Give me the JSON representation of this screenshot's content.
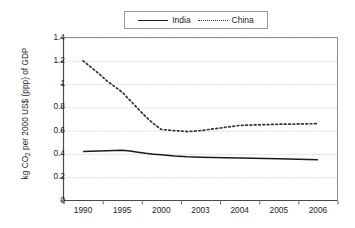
{
  "chart_data": {
    "type": "line",
    "title": "",
    "xlabel": "",
    "ylabel": "kg CO2 per 2000 US$ (ppp) of GDP",
    "ylabel_parts": {
      "before": "kg CO",
      "sub": "2",
      "after": " per 2000 US$ (ppp) of GDP"
    },
    "categories": [
      "1990",
      "1995",
      "2000",
      "2003",
      "2004",
      "2005",
      "2006"
    ],
    "ylim": [
      0,
      1.4
    ],
    "ytick_labels": [
      "0",
      "0.2",
      "0.4",
      "0.6",
      "0.8",
      "1",
      "1.2",
      "1.4"
    ],
    "ytick_values": [
      0,
      0.2,
      0.4,
      0.6,
      0.8,
      1.0,
      1.2,
      1.4
    ],
    "grid": "horizontal-dotted",
    "legend_position": "top-center",
    "series": [
      {
        "name": "India",
        "style": "solid",
        "color": "#1a1a1a",
        "values": [
          0.42,
          0.43,
          0.4,
          0.37,
          0.365,
          0.36,
          0.35
        ],
        "dense_x": [
          1990,
          1991,
          1992,
          1993,
          1994,
          1995,
          1996,
          1997,
          1998,
          1999,
          2000,
          2001,
          2002,
          2003,
          2004,
          2005,
          2006
        ],
        "dense_y": [
          0.42,
          0.423,
          0.425,
          0.428,
          0.43,
          0.432,
          0.425,
          0.415,
          0.405,
          0.398,
          0.392,
          0.382,
          0.375,
          0.372,
          0.365,
          0.358,
          0.35
        ]
      },
      {
        "name": "China",
        "style": "dotted",
        "color": "#333333",
        "values": [
          1.2,
          0.93,
          0.61,
          0.6,
          0.645,
          0.655,
          0.66
        ],
        "dense_x": [
          1990,
          1991,
          1992,
          1993,
          1994,
          1995,
          1996,
          1997,
          1998,
          1999,
          2000,
          2001,
          2002,
          2003,
          2004,
          2005,
          2006
        ],
        "dense_y": [
          1.2,
          1.145,
          1.09,
          1.03,
          0.98,
          0.93,
          0.86,
          0.79,
          0.72,
          0.66,
          0.61,
          0.6,
          0.592,
          0.6,
          0.645,
          0.655,
          0.66
        ]
      }
    ]
  },
  "legend": {
    "entries": [
      {
        "label": "India",
        "style": "solid"
      },
      {
        "label": "China",
        "style": "dotted"
      }
    ]
  }
}
